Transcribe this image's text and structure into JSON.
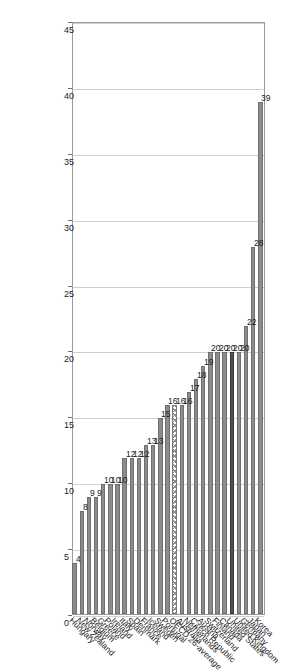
{
  "chart_data": {
    "type": "bar",
    "orientation": "horizontal",
    "title": "",
    "subtitle": "",
    "xlabel": "",
    "ylabel": "",
    "xlim": [
      0,
      45
    ],
    "xticks": [
      0,
      5,
      10,
      15,
      20,
      25,
      30,
      35,
      40,
      45
    ],
    "grid": true,
    "legend": "none",
    "categories": [
      "Korea",
      "Japan",
      "Germany",
      "United Kingdom",
      "United States",
      "Canada",
      "Finland",
      "Switzerland",
      "Austria",
      "Czech Republic",
      "Netherlands",
      "Australia",
      "OECD 26-average",
      "Portugal",
      "Sweden",
      "Iceland",
      "France",
      "Denmark",
      "Spain",
      "Italy",
      "Ireland",
      "Poland",
      "Greece",
      "Belgium",
      "Norway",
      "New Zealand",
      "Hungary"
    ],
    "values": [
      39,
      28,
      22,
      20,
      20,
      20,
      20,
      20,
      19,
      18,
      17,
      16,
      16,
      16,
      15,
      13,
      13,
      12,
      12,
      12,
      10,
      10,
      10,
      9,
      9,
      8,
      4
    ],
    "value_labels": [
      "39",
      "28",
      "22",
      "20",
      "20",
      "20",
      "20",
      "20",
      "19",
      "18",
      "17",
      "16",
      "16",
      "16",
      "15",
      "13",
      "13",
      "12",
      "12",
      "12",
      "10",
      "10",
      "10",
      "9",
      "9",
      "8",
      "4"
    ],
    "bar_styles": [
      "normal",
      "normal",
      "normal",
      "normal",
      "highlight",
      "normal",
      "normal",
      "normal",
      "normal",
      "normal",
      "normal",
      "normal",
      "hatched",
      "normal",
      "normal",
      "normal",
      "normal",
      "normal",
      "normal",
      "normal",
      "normal",
      "normal",
      "normal",
      "normal",
      "normal",
      "normal",
      "normal"
    ],
    "colors": {
      "bar": "#8c8c8c",
      "bar_edge": "#6f6f6f",
      "highlight": "#4f4f4f",
      "hatch": "#8c8c8c",
      "grid": "#cfcfcf",
      "frame": "#9a9a9a",
      "text": "#1b1b1b",
      "background": "#ffffff"
    }
  }
}
